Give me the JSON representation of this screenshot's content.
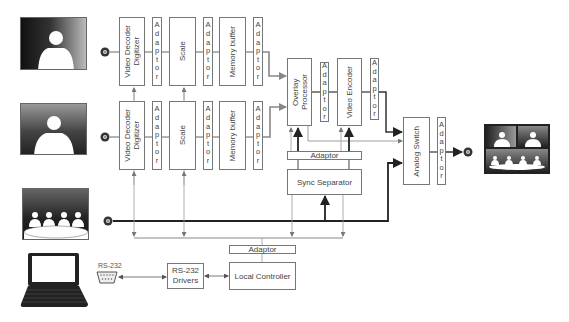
{
  "diagram": {
    "sources": [
      {
        "name": "camera-1",
        "type": "single-person"
      },
      {
        "name": "camera-2",
        "type": "single-person"
      },
      {
        "name": "camera-3",
        "type": "group"
      }
    ],
    "rows": [
      {
        "decoder": "Video Decoder\nDigitizer",
        "adaptor1": "Adaptor",
        "scale": "Scale",
        "adaptor2": "Adaptor",
        "memory": "Memory buffer",
        "adaptor3": "Adaptor"
      },
      {
        "decoder": "Video Decoder\nDigitizer",
        "adaptor1": "Adaptor",
        "scale": "Scale",
        "adaptor2": "Adaptor",
        "memory": "Memory buffer",
        "adaptor3": "Adaptor"
      }
    ],
    "overlay_processor": "Overlay\nProcessor",
    "overlay_adaptor": "Adaptor",
    "video_encoder": "Video Encoder",
    "encoder_adaptor": "Adaptor",
    "sync_adaptor": "Adaptor",
    "sync_separator": "Sync Separator",
    "analog_switch": "Analog Switch",
    "output_adaptor": "Adaptor",
    "controller_adaptor": "Adaptor",
    "local_controller": "Local Controller",
    "rs232_drivers": "RS-232\nDrivers",
    "rs232_port_label": "RS-232",
    "output": {
      "name": "composite-monitor",
      "layout": "2 singles + group"
    }
  }
}
